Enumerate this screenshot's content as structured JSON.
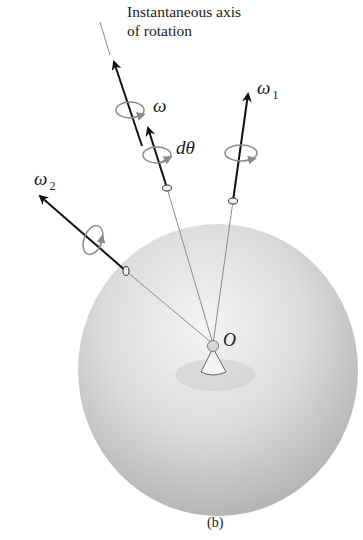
{
  "figure": {
    "title_line1": "Instantaneous axis",
    "title_line2": "of rotation",
    "caption": "(b)"
  },
  "labels": {
    "omega": "ω",
    "dtheta": "dθ",
    "omega1": "ω",
    "omega1_sub": "1",
    "omega2": "ω",
    "omega2_sub": "2",
    "origin": "O"
  },
  "colors": {
    "arrow": "#111111",
    "sphere_light": "#f2f2f2",
    "sphere_dark": "#b9b9b9",
    "ring": "#8a8a8a",
    "line": "#888888"
  }
}
